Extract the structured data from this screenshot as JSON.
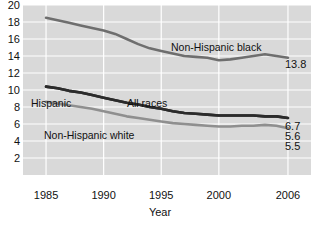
{
  "chart_data": {
    "type": "line",
    "title": "",
    "xlabel": "Year",
    "ylabel": "",
    "xlim": [
      1983,
      2008
    ],
    "ylim": [
      0,
      20
    ],
    "grid": true,
    "legend_position": "inline-annotations",
    "x_ticks": [
      "1985",
      "1990",
      "1995",
      "2000",
      "2006"
    ],
    "x_tick_values": [
      1985,
      1990,
      1995,
      2000,
      2006
    ],
    "y_ticks": [
      "2",
      "4",
      "6",
      "8",
      "10",
      "12",
      "14",
      "16",
      "18",
      "20"
    ],
    "y_tick_values": [
      2,
      4,
      6,
      8,
      10,
      12,
      14,
      16,
      18,
      20
    ],
    "x": [
      1985,
      1986,
      1987,
      1988,
      1989,
      1990,
      1991,
      1992,
      1993,
      1994,
      1995,
      1996,
      1997,
      1998,
      1999,
      2000,
      2001,
      2002,
      2003,
      2004,
      2005,
      2006
    ],
    "series": [
      {
        "name": "Non-Hispanic black",
        "color": "#6e6e6e",
        "end_value": 13.8,
        "values": [
          18.5,
          18.2,
          17.9,
          17.6,
          17.3,
          17.0,
          16.6,
          16.0,
          15.4,
          14.9,
          14.6,
          14.3,
          14.0,
          13.9,
          13.8,
          13.5,
          13.6,
          13.8,
          14.0,
          14.2,
          14.0,
          13.8
        ]
      },
      {
        "name": "All races",
        "color": "#2b2b2b",
        "end_value": 6.7,
        "values": [
          10.4,
          10.2,
          9.9,
          9.7,
          9.4,
          9.1,
          8.8,
          8.5,
          8.3,
          8.0,
          7.8,
          7.5,
          7.3,
          7.2,
          7.1,
          7.0,
          7.0,
          7.0,
          7.0,
          6.9,
          6.9,
          6.7
        ]
      },
      {
        "name": "Hispanic",
        "color": "#2b2b2b",
        "end_value": 5.6,
        "values": [
          10.4,
          10.2,
          9.9,
          9.7,
          9.4,
          9.1,
          8.8,
          8.5,
          8.3,
          8.0,
          7.8,
          7.5,
          7.3,
          7.2,
          7.1,
          7.0,
          7.0,
          7.0,
          7.0,
          6.9,
          6.9,
          6.7
        ]
      },
      {
        "name": "Non-Hispanic white",
        "color": "#8f8f8f",
        "end_value": 5.5,
        "values": [
          8.6,
          8.4,
          8.2,
          8.0,
          7.8,
          7.5,
          7.2,
          6.9,
          6.7,
          6.5,
          6.3,
          6.1,
          6.0,
          5.9,
          5.8,
          5.7,
          5.7,
          5.8,
          5.8,
          5.9,
          5.8,
          5.5
        ]
      }
    ],
    "annotations": [
      {
        "text": "Non-Hispanic black",
        "x": 171,
        "y": 42
      },
      {
        "text": "Hispanic",
        "x": 31,
        "y": 98
      },
      {
        "text": "All races",
        "x": 127,
        "y": 98
      },
      {
        "text": "Non-Hispanic white",
        "x": 44,
        "y": 130
      }
    ],
    "end_labels": [
      {
        "text": "13.8",
        "x": 285,
        "y": 59
      },
      {
        "text": "6.7",
        "x": 285,
        "y": 121
      },
      {
        "text": "5.6",
        "x": 285,
        "y": 131
      },
      {
        "text": "5.5",
        "x": 285,
        "y": 141
      }
    ]
  },
  "colors": {
    "plot_background": "#d9d9d9",
    "gridline": "#ffffff",
    "text": "#111111",
    "page_background": "#ffffff"
  }
}
